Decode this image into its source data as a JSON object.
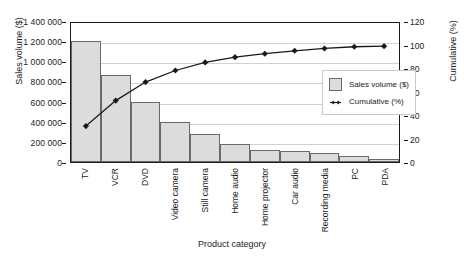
{
  "chart_data": {
    "type": "bar",
    "title": "",
    "xlabel": "Product category",
    "ylabel": "Sales volume ($)",
    "y2label": "Cumulative (%)",
    "grid": true,
    "legend_position": "inside-right",
    "categories": [
      "TV",
      "VCR",
      "DVD",
      "Video camera",
      "Still camera",
      "Home audio",
      "Home projector",
      "Car audio",
      "Recording media",
      "PC",
      "PDA"
    ],
    "ylim": [
      0,
      1400000
    ],
    "y2lim": [
      0,
      120
    ],
    "yticks": [
      "0",
      "200 000",
      "400 000",
      "600 000",
      "800 000",
      "1 000 000",
      "1 200 000",
      "1 400 000"
    ],
    "ytick_values": [
      0,
      200000,
      400000,
      600000,
      800000,
      1000000,
      1200000,
      1400000
    ],
    "y2ticks": [
      "0",
      "20",
      "40",
      "60",
      "80",
      "100",
      "120"
    ],
    "y2tick_values": [
      0,
      20,
      40,
      60,
      80,
      100,
      120
    ],
    "series": [
      {
        "name": "Sales volume ($)",
        "kind": "bar",
        "axis": "left",
        "color": "#dcdcdc",
        "edge_color": "#6a6a6a",
        "values": [
          1200000,
          860000,
          600000,
          400000,
          280000,
          180000,
          120000,
          105000,
          85000,
          60000,
          25000
        ]
      },
      {
        "name": "Cumulative (%)",
        "kind": "line",
        "axis": "right",
        "color": "#1a1a1a",
        "marker": "diamond",
        "values": [
          31,
          53,
          69,
          79,
          86,
          90.5,
          93.5,
          96,
          98,
          99.5,
          100
        ]
      }
    ]
  },
  "legend": {
    "items": [
      {
        "label": "Sales volume ($)",
        "marker": "swatch"
      },
      {
        "label": "Cumulative (%)",
        "marker": "line-diamond"
      }
    ]
  }
}
